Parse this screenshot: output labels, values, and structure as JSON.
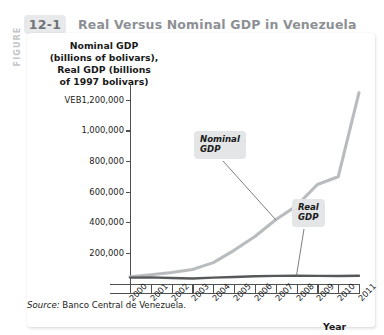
{
  "figure": {
    "figure_word": "FIGURE",
    "number": "12-1",
    "title": "Real Versus Nominal GDP in Venezuela"
  },
  "source": {
    "label": "Source:",
    "text": "Banco Central de Venezuela."
  },
  "callouts": {
    "nominal_line1": "Nominal",
    "nominal_line2": "GDP",
    "real_line1": "Real",
    "real_line2": "GDP"
  },
  "chart_data": {
    "type": "line",
    "title": "Real Versus Nominal GDP in Venezuela",
    "ylabel_lines": [
      "Nominal GDP",
      "(billions of bolivars),",
      "Real GDP (billions",
      "of 1997 bolivars)"
    ],
    "xlabel": "Year",
    "categories": [
      "2000",
      "2001",
      "2002",
      "2003",
      "2004",
      "2005",
      "2006",
      "2007",
      "2008",
      "2009",
      "2010",
      "2011"
    ],
    "ytick_labels": [
      "VEB1,200,000",
      "1,000,000",
      "800,000",
      "600,000",
      "400,000",
      "200,000"
    ],
    "ytick_values": [
      1200000,
      1000000,
      800000,
      600000,
      400000,
      200000
    ],
    "ylim": [
      0,
      1300000
    ],
    "grid": false,
    "legend": "annotations",
    "series": [
      {
        "name": "Nominal GDP",
        "color": "#b9bcbe",
        "values": [
          48000,
          60000,
          75000,
          95000,
          140000,
          220000,
          310000,
          420000,
          510000,
          650000,
          700000,
          1250000
        ]
      },
      {
        "name": "Real GDP",
        "color": "#57585a",
        "values": [
          42000,
          43000,
          39000,
          36000,
          42000,
          46000,
          50000,
          53000,
          55000,
          53000,
          52000,
          54000
        ]
      }
    ]
  }
}
